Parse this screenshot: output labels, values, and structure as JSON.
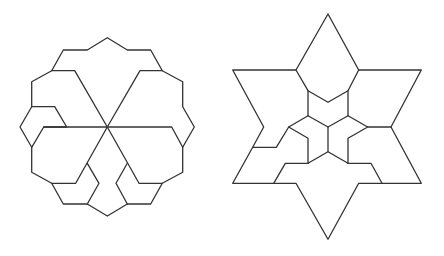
{
  "diagram": {
    "background": "#ffffff",
    "stroke_color": "#333333",
    "figures": [
      {
        "name": "dodecagon-dissection",
        "outline": [
          [
            107.3,
            37.7
          ],
          [
            127.3,
            50
          ],
          [
            150.7,
            50
          ],
          [
            162.3,
            70.7
          ],
          [
            182.7,
            81.7
          ],
          [
            182.7,
            106.7
          ],
          [
            194.3,
            127
          ],
          [
            182.7,
            147.3
          ],
          [
            182.7,
            172.3
          ],
          [
            162.3,
            183.3
          ],
          [
            150.7,
            204
          ],
          [
            127.3,
            204
          ],
          [
            107.3,
            216
          ],
          [
            87.3,
            204
          ],
          [
            63.3,
            204
          ],
          [
            51.7,
            183.3
          ],
          [
            31.7,
            172.3
          ],
          [
            31.7,
            147.3
          ],
          [
            20,
            127
          ],
          [
            31.7,
            106.7
          ],
          [
            31.7,
            81.7
          ],
          [
            51.7,
            70.7
          ],
          [
            63.3,
            50
          ],
          [
            87.3,
            50
          ]
        ],
        "inner_paths": [
          [
            [
              51.7,
              70.7
            ],
            [
              74.7,
              70.7
            ],
            [
              107.3,
              127
            ],
            [
              140,
              70.7
            ],
            [
              162.3,
              70.7
            ]
          ],
          [
            [
              31.7,
              106.7
            ],
            [
              54.7,
              106.7
            ],
            [
              66.7,
              127
            ],
            [
              43.7,
              127
            ],
            [
              31.7,
              147.3
            ]
          ],
          [
            [
              43.7,
              127
            ],
            [
              171.7,
              127
            ],
            [
              182.7,
              147.3
            ]
          ],
          [
            [
              107.3,
              127
            ],
            [
              75.7,
              183.3
            ],
            [
              51.7,
              183.3
            ]
          ],
          [
            [
              107.3,
              127
            ],
            [
              139,
              183.3
            ],
            [
              162.3,
              183.3
            ]
          ],
          [
            [
              87.3,
              163.3
            ],
            [
              99,
              183.3
            ],
            [
              87.3,
              204
            ]
          ],
          [
            [
              127.3,
              163.3
            ],
            [
              116,
              183.3
            ],
            [
              127.3,
              204
            ]
          ]
        ]
      },
      {
        "name": "hexagram-dissection",
        "outline": [
          [
            328,
            14
          ],
          [
            358.7,
            70
          ],
          [
            421.3,
            70
          ],
          [
            391,
            127
          ],
          [
            421.3,
            183.3
          ],
          [
            358.7,
            183.3
          ],
          [
            328,
            239.3
          ],
          [
            296,
            183.3
          ],
          [
            232.7,
            183.3
          ],
          [
            252.7,
            147.3
          ],
          [
            263.7,
            127
          ],
          [
            232.7,
            70
          ],
          [
            296,
            70
          ]
        ],
        "inner_paths": [
          [
            [
              296,
              70
            ],
            [
              308,
              90.7
            ],
            [
              328,
              102.3
            ],
            [
              348,
              90.7
            ],
            [
              358.7,
              70
            ]
          ],
          [
            [
              308,
              90.7
            ],
            [
              308,
              115.7
            ],
            [
              328,
              127
            ],
            [
              348,
              115.7
            ],
            [
              348,
              90.7
            ]
          ],
          [
            [
              308,
              115.7
            ],
            [
              288.7,
              127
            ],
            [
              276.3,
              147.3
            ],
            [
              252.7,
              147.3
            ]
          ],
          [
            [
              288.7,
              127
            ],
            [
              308,
              138.3
            ],
            [
              308,
              163.3
            ],
            [
              328,
              151.7
            ],
            [
              348,
              163.3
            ],
            [
              348,
              138.3
            ],
            [
              367.7,
              127
            ],
            [
              348,
              115.7
            ]
          ],
          [
            [
              328,
              127
            ],
            [
              328,
              151.7
            ]
          ],
          [
            [
              367.7,
              127
            ],
            [
              391,
              127
            ]
          ],
          [
            [
              308,
              163.3
            ],
            [
              285.3,
              163.3
            ],
            [
              273.7,
              183.3
            ]
          ],
          [
            [
              348,
              163.3
            ],
            [
              371,
              163.3
            ],
            [
              382,
              183.3
            ]
          ]
        ]
      }
    ]
  }
}
